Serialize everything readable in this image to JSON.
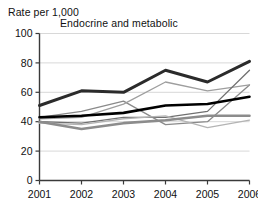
{
  "chart_data": {
    "type": "line",
    "title": "Endocrine and metabolic",
    "ylabel": "Rate per 1,000",
    "xlabel": "",
    "categories": [
      "2001",
      "2002",
      "2003",
      "2004",
      "2005",
      "2006"
    ],
    "x": [
      2001,
      2002,
      2003,
      2004,
      2005,
      2006
    ],
    "ylim": [
      0,
      100
    ],
    "yticks": [
      0,
      20,
      40,
      60,
      80,
      100
    ],
    "grid": "horizontal",
    "legend": "none",
    "series": [
      {
        "name": "series-1-thick-dark",
        "color": "#2b2b2b",
        "width": 3.0,
        "values": [
          51,
          61,
          60,
          75,
          67,
          81
        ]
      },
      {
        "name": "series-2-black",
        "color": "#000000",
        "width": 2.6,
        "values": [
          43,
          44,
          46,
          51,
          52,
          57
        ]
      },
      {
        "name": "series-3-grey-mid",
        "color": "#8c8c8c",
        "width": 2.6,
        "values": [
          40,
          35,
          39,
          41,
          44,
          44
        ]
      },
      {
        "name": "series-4-thin-grey-rising",
        "color": "#8a8a8a",
        "width": 1.3,
        "values": [
          43,
          47,
          54,
          38,
          40,
          65
        ]
      },
      {
        "name": "series-5-thin-light",
        "color": "#9e9e9e",
        "width": 1.3,
        "values": [
          42,
          43,
          52,
          67,
          61,
          65
        ]
      },
      {
        "name": "series-6-thin-steep",
        "color": "#707070",
        "width": 1.3,
        "values": [
          40,
          39,
          43,
          43,
          47,
          75
        ]
      },
      {
        "name": "series-7-thin-pale",
        "color": "#b4b4b4",
        "width": 1.3,
        "values": [
          39,
          38,
          42,
          44,
          36,
          41
        ]
      }
    ]
  }
}
